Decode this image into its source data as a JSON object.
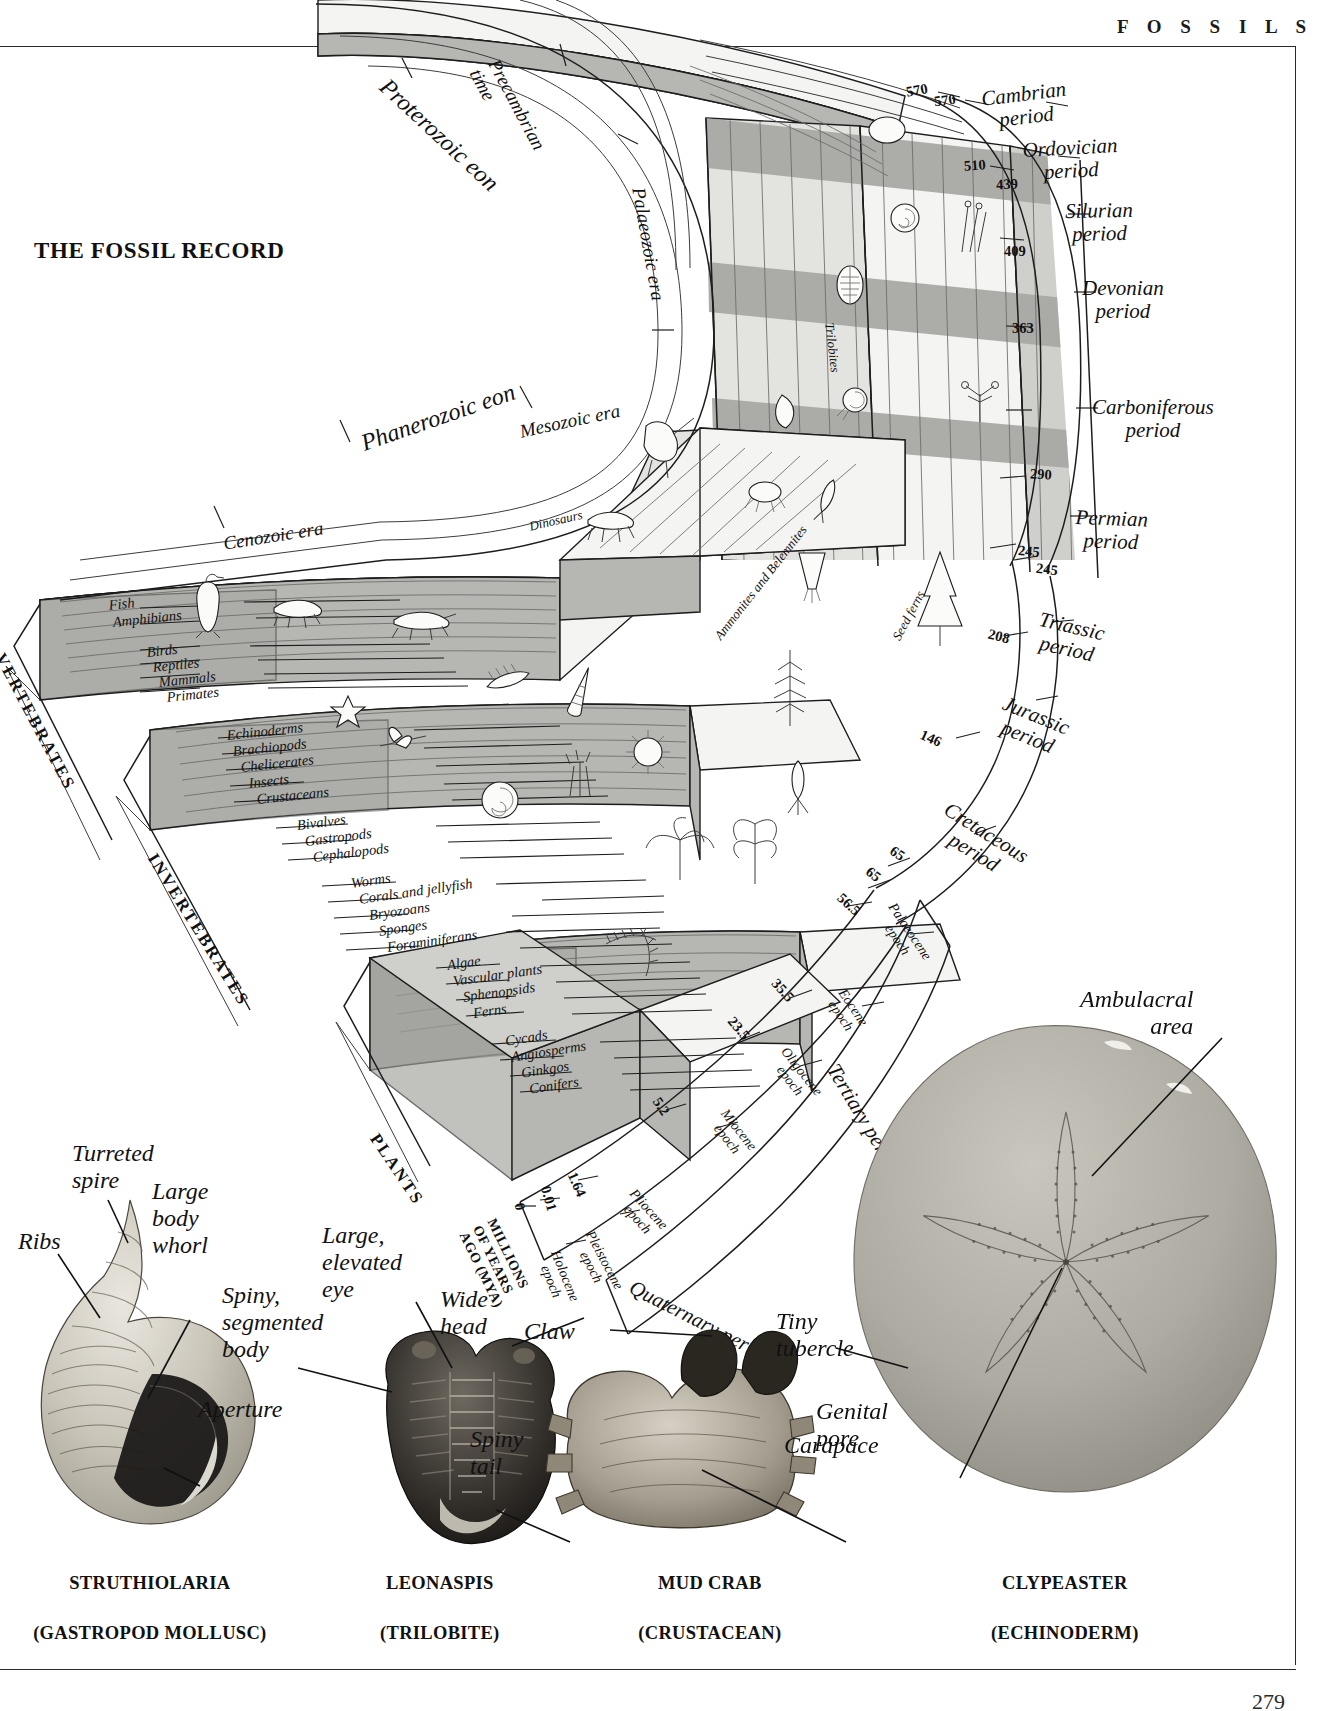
{
  "running_head": "F O S S I L S",
  "page_number": "279",
  "title": "THE FOSSIL RECORD",
  "eons": [
    {
      "label": "Proterozoic eon"
    },
    {
      "label": "Phanerozoic eon"
    }
  ],
  "eras": [
    {
      "label": "Precambrian\ntime"
    },
    {
      "label": "Palaeozoic era"
    },
    {
      "label": "Mesozoic era"
    },
    {
      "label": "Cenozoic era"
    }
  ],
  "periods": [
    {
      "label": "Cambrian\nperiod",
      "start": 570
    },
    {
      "label": "Ordovician\nperiod",
      "start": 510
    },
    {
      "label": "Silurian\nperiod",
      "start": 439
    },
    {
      "label": "Devonian\nperiod",
      "start": 409
    },
    {
      "label": "Carboniferous\nperiod",
      "start": 363
    },
    {
      "label": "Permian\nperiod",
      "start": 290
    },
    {
      "label": "Triassic\nperiod",
      "start": 245
    },
    {
      "label": "Jurassic\nperiod",
      "start": 208
    },
    {
      "label": "Cretaceous\nperiod",
      "start": 146
    },
    {
      "label": "Tertiary period",
      "start": 65
    },
    {
      "label": "Quaternary period",
      "start": 1.64
    }
  ],
  "epochs": [
    {
      "label": "Palaeocene\nepoch",
      "start": 65
    },
    {
      "label": "Eocene\nepoch",
      "start": 56.5
    },
    {
      "label": "Oligocene\nepoch",
      "start": 35.5
    },
    {
      "label": "Miocene\nepoch",
      "start": 23.5
    },
    {
      "label": "Pliocene\nepoch",
      "start": 5.2
    },
    {
      "label": "Pleistocene\nepoch",
      "start": 1.64
    },
    {
      "label": "Holocene\nepoch",
      "start": 0.01
    }
  ],
  "age_ticks_outer": [
    "570",
    "510",
    "439",
    "409",
    "363",
    "290",
    "245"
  ],
  "age_ticks_inner": [
    "570",
    "245",
    "208",
    "146",
    "65"
  ],
  "age_ticks_epoch": [
    "65",
    "56.5",
    "35.5",
    "23.5",
    "5.2",
    "1.64",
    "0.01",
    "0"
  ],
  "axis_label": "MILLIONS\nOF YEARS\nAGO (MYA)",
  "group_headings": [
    {
      "label": "VERTEBRATES"
    },
    {
      "label": "INVERTEBRATES"
    },
    {
      "label": "PLANTS"
    }
  ],
  "vertebrate_rows": [
    "Fish",
    "Amphibians",
    "Birds",
    "Reptiles",
    "Mammals",
    "Primates"
  ],
  "invertebrate_rows": [
    "Echinoderms",
    "Brachiopods",
    "Chelicerates",
    "Insects",
    "Crustaceans",
    "Bivalves",
    "Gastropods",
    "Cephalopods",
    "Worms",
    "Corals and jellyfish",
    "Bryozoans",
    "Sponges",
    "Foraminiferans"
  ],
  "plant_rows": [
    "Algae",
    "Vascular plants",
    "Sphenopsids",
    "Ferns",
    "Cycads",
    "Angiosperms",
    "Ginkgos",
    "Conifers"
  ],
  "diagram_callouts": [
    {
      "label": "Trilobites"
    },
    {
      "label": "Dinosaurs"
    },
    {
      "label": "Ammonites and Belemnites"
    },
    {
      "label": "Seed ferns"
    }
  ],
  "specimens": [
    {
      "name": "STRUTHIOLARIA",
      "subtitle": "(GASTROPOD MOLLUSC)",
      "labels": [
        "Turreted\nspire",
        "Ribs",
        "Large\nbody\nwhorl",
        "Aperture"
      ]
    },
    {
      "name": "LEONASPIS",
      "subtitle": "(TRILOBITE)",
      "labels": [
        "Large,\nelevated\neye",
        "Spiny,\nsegmented\nbody",
        "Wide\nhead",
        "Spiny\ntail"
      ]
    },
    {
      "name": "MUD CRAB",
      "subtitle": "(CRUSTACEAN)",
      "labels": [
        "Claw",
        "Carapace"
      ]
    },
    {
      "name": "CLYPEASTER",
      "subtitle": "(ECHINODERM)",
      "labels": [
        "Ambulacral\narea",
        "Tiny\ntubercle",
        "Genital\npore"
      ]
    }
  ],
  "colors": {
    "ink": "#111111",
    "rule": "#2a2a2a",
    "block_top_light": "#f4f4f2",
    "block_top_mid": "#e2e2df",
    "block_top_dark": "#c8c8c4",
    "block_side": "#b6b6b2",
    "band_shade": "#9e9e9a"
  }
}
